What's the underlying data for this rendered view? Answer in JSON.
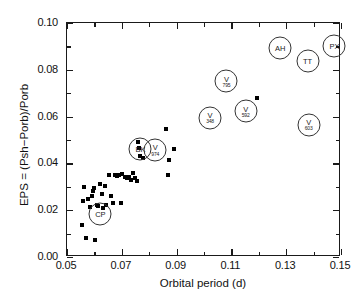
{
  "chart_data": {
    "type": "scatter",
    "title": "",
    "xlabel": "Orbital period (d)",
    "ylabel": "EPS = (Psh−Porb)/Porb",
    "xlim": [
      0.05,
      0.15
    ],
    "ylim": [
      0.0,
      0.1
    ],
    "xticks": [
      "0.05",
      "0.07",
      "0.09",
      "0.11",
      "0.13",
      "0.15"
    ],
    "xtick_values": [
      0.05,
      0.07,
      0.09,
      0.11,
      0.13,
      0.15
    ],
    "xminor_values": [
      0.06,
      0.08,
      0.1,
      0.12,
      0.14
    ],
    "yticks": [
      "0.00",
      "0.02",
      "0.04",
      "0.06",
      "0.08",
      "0.10"
    ],
    "ytick_values": [
      0.0,
      0.02,
      0.04,
      0.06,
      0.08,
      0.1
    ],
    "yminor_values": [
      0.01,
      0.03,
      0.05,
      0.07,
      0.09
    ],
    "grid": false,
    "legend": "none",
    "marker": "filled-square",
    "points": [
      {
        "x": 0.0555,
        "y": 0.0136
      },
      {
        "x": 0.0558,
        "y": 0.024
      },
      {
        "x": 0.0562,
        "y": 0.03
      },
      {
        "x": 0.0568,
        "y": 0.008
      },
      {
        "x": 0.0578,
        "y": 0.0246
      },
      {
        "x": 0.0585,
        "y": 0.0212
      },
      {
        "x": 0.059,
        "y": 0.0262
      },
      {
        "x": 0.0596,
        "y": 0.0283
      },
      {
        "x": 0.06,
        "y": 0.0296
      },
      {
        "x": 0.0604,
        "y": 0.0072
      },
      {
        "x": 0.0608,
        "y": 0.0222
      },
      {
        "x": 0.0612,
        "y": 0.0218
      },
      {
        "x": 0.062,
        "y": 0.031
      },
      {
        "x": 0.0628,
        "y": 0.0268
      },
      {
        "x": 0.0632,
        "y": 0.021
      },
      {
        "x": 0.0638,
        "y": 0.0302
      },
      {
        "x": 0.0644,
        "y": 0.0224
      },
      {
        "x": 0.0652,
        "y": 0.035
      },
      {
        "x": 0.066,
        "y": 0.0262
      },
      {
        "x": 0.0668,
        "y": 0.0232
      },
      {
        "x": 0.0676,
        "y": 0.0352
      },
      {
        "x": 0.0684,
        "y": 0.0348
      },
      {
        "x": 0.069,
        "y": 0.0352
      },
      {
        "x": 0.0696,
        "y": 0.0232
      },
      {
        "x": 0.0702,
        "y": 0.0354
      },
      {
        "x": 0.071,
        "y": 0.034
      },
      {
        "x": 0.0718,
        "y": 0.0338
      },
      {
        "x": 0.0726,
        "y": 0.0344
      },
      {
        "x": 0.0734,
        "y": 0.033
      },
      {
        "x": 0.0742,
        "y": 0.0358
      },
      {
        "x": 0.0748,
        "y": 0.0336
      },
      {
        "x": 0.0754,
        "y": 0.0324
      },
      {
        "x": 0.076,
        "y": 0.049
      },
      {
        "x": 0.0764,
        "y": 0.0466
      },
      {
        "x": 0.0768,
        "y": 0.0432
      },
      {
        "x": 0.0776,
        "y": 0.0424
      },
      {
        "x": 0.0862,
        "y": 0.0546
      },
      {
        "x": 0.0868,
        "y": 0.0352
      },
      {
        "x": 0.0872,
        "y": 0.0414
      },
      {
        "x": 0.089,
        "y": 0.046
      },
      {
        "x": 0.1192,
        "y": 0.068
      }
    ],
    "labeled_points": [
      {
        "label_lines": [
          "CP"
        ],
        "x": 0.0622,
        "y": 0.0182
      },
      {
        "label_lines": [
          "BK"
        ],
        "x": 0.0768,
        "y": 0.0462
      },
      {
        "label_lines": [
          "V",
          "974"
        ],
        "x": 0.0822,
        "y": 0.0458
      },
      {
        "label_lines": [
          "V",
          "348"
        ],
        "x": 0.1022,
        "y": 0.0596
      },
      {
        "label_lines": [
          "V",
          "795"
        ],
        "x": 0.1082,
        "y": 0.0752
      },
      {
        "label_lines": [
          "V",
          "592"
        ],
        "x": 0.1152,
        "y": 0.0622
      },
      {
        "label_lines": [
          "AH"
        ],
        "x": 0.1278,
        "y": 0.0892
      },
      {
        "label_lines": [
          "TT"
        ],
        "x": 0.1378,
        "y": 0.0836
      },
      {
        "label_lines": [
          "V",
          "603"
        ],
        "x": 0.1382,
        "y": 0.0566
      },
      {
        "label_lines": [
          "PX"
        ],
        "x": 0.1476,
        "y": 0.09
      }
    ]
  }
}
